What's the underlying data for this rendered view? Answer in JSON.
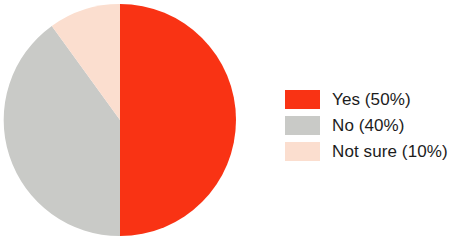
{
  "chart_data": {
    "type": "pie",
    "title": "",
    "labels": [
      "Yes",
      "No",
      "Not sure"
    ],
    "values": [
      50,
      40,
      10
    ],
    "value_unit": "%",
    "legend_entries": [
      {
        "label": "Yes (50%)",
        "name": "Yes",
        "value": 50,
        "color": "#f93314"
      },
      {
        "label": "No (40%)",
        "name": "No",
        "value": 40,
        "color": "#c9cac7"
      },
      {
        "label": "Not sure (10%)",
        "name": "Not sure",
        "value": 10,
        "color": "#fbdecf"
      }
    ],
    "legend_position": "right",
    "start_angle_deg": 0,
    "direction": "clockwise",
    "grid": false,
    "xlabel": "",
    "ylabel": ""
  },
  "colors": {
    "yes": "#f93314",
    "no": "#c9cac7",
    "not_sure": "#fbdecf",
    "background": "#ffffff",
    "text": "#1c1c1c"
  },
  "slices": [
    {
      "name": "Yes",
      "value": 50,
      "color": "#f93314",
      "path": "M 118 118 L 118 2 A 116 116 0 0 1 118 234 Z"
    },
    {
      "name": "No",
      "value": 40,
      "color": "#c9cac7",
      "path": "M 118 118 L 118 234 A 116 116 0 0 1 49.81 23.93 Z"
    },
    {
      "name": "Not sure",
      "value": 10,
      "color": "#fbdecf",
      "path": "M 118 118 L 49.81 23.93 A 116 116 0 0 1 118 2 Z"
    }
  ]
}
